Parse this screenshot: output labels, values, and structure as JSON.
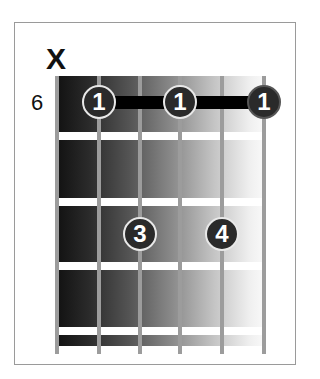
{
  "diagram": {
    "type": "guitar-chord-chart",
    "start_fret_label": "6",
    "mute_symbol": "X",
    "strings_count": 6,
    "frets_shown": 4,
    "muted_strings": [
      1
    ],
    "barre": {
      "finger": "1",
      "fret": 1,
      "from_string": 2,
      "to_string": 6
    },
    "fingers": [
      {
        "string": 2,
        "fret": 1,
        "label": "1"
      },
      {
        "string": 4,
        "fret": 1,
        "label": "1"
      },
      {
        "string": 6,
        "fret": 1,
        "label": "1"
      },
      {
        "string": 3,
        "fret": 3,
        "label": "3"
      },
      {
        "string": 5,
        "fret": 3,
        "label": "4"
      }
    ],
    "colors": {
      "marker": "#2a2a2a",
      "barre": "#000000",
      "string": "#9c9c9c",
      "fret": "#ffffff"
    }
  }
}
